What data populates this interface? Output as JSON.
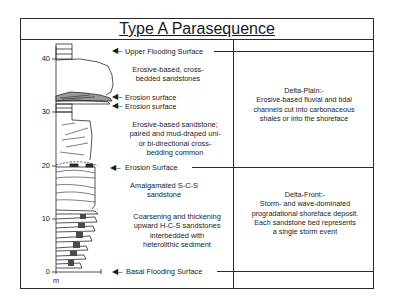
{
  "title": "Type A Parasequence",
  "axis": {
    "unit": "m",
    "ticks": [
      "40",
      "30",
      "20",
      "10",
      "0"
    ]
  },
  "surfaces": {
    "upper_flooding": "Upper Flooding Surface",
    "erosion_1": "Erosion surface",
    "erosion_2": "Erosion surface",
    "erosion_main": "Erosion Surface",
    "basal_flooding": "Basal Flooding Surface"
  },
  "descriptions": {
    "cross_bedded": [
      "Erosive-based, cross-",
      "bedded sandstones"
    ],
    "erosive_sandstone": [
      "Erosive-based sandstone;",
      "paired and mud-draped uni-",
      "or bi-directional cross-",
      "bedding common"
    ],
    "amalgamated": [
      "Amalgamated S-C-S",
      "sandstone"
    ],
    "coarsening": [
      "Coarsening and thickening",
      "upward H-C-S sandstones",
      "interbedded with",
      "heterolithic sediment"
    ]
  },
  "environments": {
    "delta_plain": [
      "Delta-Plain:-",
      "Erosive-based fluvial and tidal",
      "channels cut into carbonaceous",
      "shales or into the shoreface"
    ],
    "delta_front": [
      "Delta-Front:-",
      "Storm- and wave-dominated",
      "progradational shoreface deposit.",
      "Each sandstone bed represents",
      "a single storm event"
    ]
  },
  "colors": {
    "line": "#2a2a2a",
    "text": "#1a1a1a",
    "background": "#ffffff"
  }
}
